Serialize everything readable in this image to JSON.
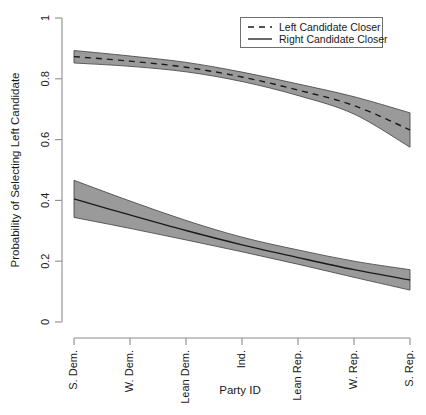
{
  "chart_data": {
    "type": "line",
    "title": "",
    "xlabel": "Party ID",
    "ylabel": "Probability of Selecting Left Candidate",
    "categories": [
      "S. Dem.",
      "W. Dem.",
      "Lean Dem.",
      "Ind.",
      "Lean Rep.",
      "W. Rep.",
      "S. Rep."
    ],
    "x": [
      1,
      2,
      3,
      4,
      5,
      6,
      7
    ],
    "ylim": [
      0,
      1
    ],
    "yticks": [
      0,
      0.2,
      0.4,
      0.6,
      0.8,
      1
    ],
    "ytick_labels": [
      "0",
      "0.2",
      "0.4",
      "0.6",
      "0.8",
      "1"
    ],
    "grid": false,
    "legend_position": "top-right",
    "series": [
      {
        "name": "Left Candidate Closer",
        "style": "dashed",
        "values": [
          0.873,
          0.858,
          0.838,
          0.806,
          0.763,
          0.712,
          0.632
        ],
        "ci_lower": [
          0.852,
          0.841,
          0.823,
          0.791,
          0.745,
          0.684,
          0.575
        ],
        "ci_upper": [
          0.893,
          0.875,
          0.854,
          0.822,
          0.783,
          0.741,
          0.688
        ]
      },
      {
        "name": "Right Candidate Closer",
        "style": "solid",
        "values": [
          0.405,
          0.352,
          0.301,
          0.254,
          0.212,
          0.172,
          0.138
        ],
        "ci_lower": [
          0.344,
          0.308,
          0.27,
          0.231,
          0.19,
          0.147,
          0.105
        ],
        "ci_upper": [
          0.466,
          0.398,
          0.334,
          0.279,
          0.237,
          0.2,
          0.172
        ]
      }
    ]
  },
  "legend": {
    "entries": [
      {
        "label": "Left Candidate Closer",
        "style": "dashed"
      },
      {
        "label": "Right Candidate Closer",
        "style": "solid"
      }
    ]
  },
  "colors": {
    "band_fill": "#9a9a9a",
    "line": "#1a1a1a",
    "axis": "#8d8d8d",
    "background": "#ffffff"
  }
}
